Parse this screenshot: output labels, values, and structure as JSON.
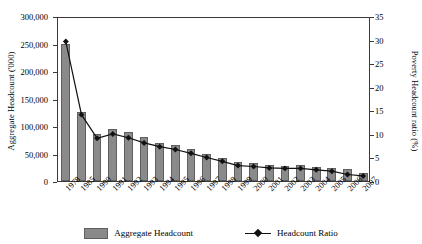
{
  "chart_data": {
    "type": "bar",
    "title": "",
    "xlabel": "",
    "ylabel": "Aggregate Headcount ('000)",
    "y2label": "Poverty Headcount ratio (%)",
    "ylim": [
      0,
      300000
    ],
    "y2lim": [
      0,
      35
    ],
    "yticks": [
      "0",
      "50,000",
      "100,000",
      "150,000",
      "200,000",
      "250,000",
      "300,000"
    ],
    "ytick_values": [
      0,
      50000,
      100000,
      150000,
      200000,
      250000,
      300000
    ],
    "y2ticks": [
      "0",
      "5",
      "10",
      "15",
      "20",
      "25",
      "30",
      "35"
    ],
    "y2tick_values": [
      0,
      5,
      10,
      15,
      20,
      25,
      30,
      35
    ],
    "grid": false,
    "legend_position": "bottom",
    "categories": [
      "1978",
      "1985",
      "1990",
      "1991",
      "1992",
      "1993",
      "1994",
      "1995",
      "1996",
      "1997",
      "1998",
      "1999",
      "2000",
      "2001",
      "2002",
      "2003",
      "2004",
      "2005",
      "2006",
      "2007"
    ],
    "series": [
      {
        "name": "Aggregate Headcount",
        "axis": "left",
        "type": "bar",
        "color": "#8a8a8a",
        "values": [
          250000,
          125000,
          85000,
          94000,
          90000,
          80000,
          70000,
          65000,
          58000,
          50000,
          42000,
          34000,
          32000,
          29000,
          28000,
          29000,
          26000,
          23000,
          21000,
          15000
        ]
      },
      {
        "name": "Headcount Ratio",
        "axis": "right",
        "type": "line",
        "color": "#111111",
        "values": [
          30.0,
          14.5,
          9.5,
          10.4,
          9.6,
          8.5,
          7.7,
          7.1,
          6.3,
          5.4,
          4.6,
          3.7,
          3.5,
          3.2,
          3.1,
          3.1,
          2.8,
          2.5,
          1.8,
          1.5
        ]
      }
    ]
  }
}
